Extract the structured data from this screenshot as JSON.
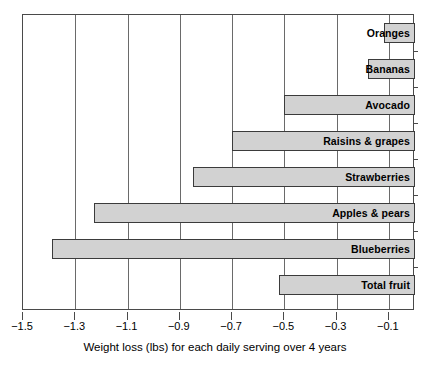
{
  "chart_data": {
    "type": "bar",
    "orientation": "horizontal",
    "title": "",
    "subtitle": "",
    "xlabel": "Weight loss (lbs) for each daily serving over 4 years",
    "ylabel": "",
    "xlim": [
      -1.5,
      0.0
    ],
    "ylim": null,
    "grid": true,
    "grid_axis": "x",
    "legend": null,
    "legend_position": "none",
    "bar_fill_color": "#d2d2d2",
    "bar_edge_color": "#3b3b3b",
    "categories": [
      "Oranges",
      "Bananas",
      "Avocado",
      "Raisins & grapes",
      "Strawberries",
      "Apples & pears",
      "Blueberries",
      "Total fruit"
    ],
    "values": [
      -0.12,
      -0.18,
      -0.5,
      -0.7,
      -0.85,
      -1.23,
      -1.39,
      -0.52
    ],
    "xticks": [
      -1.5,
      -1.3,
      -1.1,
      -0.9,
      -0.7,
      -0.5,
      -0.3,
      -0.1
    ],
    "xticklabels": [
      "−1.5",
      "−1.3",
      "−1.1",
      "−0.9",
      "−0.7",
      "−0.5",
      "−0.3",
      "−0.1"
    ],
    "bars": [
      {
        "label": "Oranges",
        "value": -0.12
      },
      {
        "label": "Bananas",
        "value": -0.18
      },
      {
        "label": "Avocado",
        "value": -0.5
      },
      {
        "label": "Raisins & grapes",
        "value": -0.7
      },
      {
        "label": "Strawberries",
        "value": -0.85
      },
      {
        "label": "Apples & pears",
        "value": -1.23
      },
      {
        "label": "Blueberries",
        "value": -1.39
      },
      {
        "label": "Total fruit",
        "value": -0.52
      }
    ]
  }
}
